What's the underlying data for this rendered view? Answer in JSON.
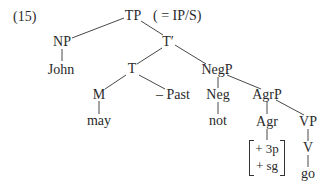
{
  "example_number": "(15)",
  "annotation": "( = IP/S)",
  "nodes": {
    "TP": "TP",
    "NP": "NP",
    "T_bar": "T′",
    "John": "John",
    "T": "T",
    "NegP": "NegP",
    "M": "M",
    "Past": "– Past",
    "Neg": "Neg",
    "AgrP": "AgrP",
    "may": "may",
    "not": "not",
    "Agr": "Agr",
    "VP": "VP",
    "V": "V",
    "go": "go"
  },
  "agr_features": [
    "+ 3p",
    "+ sg"
  ],
  "tree": {
    "label": "TP",
    "children": [
      {
        "label": "NP",
        "children": [
          {
            "label": "John"
          }
        ]
      },
      {
        "label": "T′",
        "children": [
          {
            "label": "T",
            "children": [
              {
                "label": "M",
                "children": [
                  {
                    "label": "may"
                  }
                ]
              },
              {
                "label": "– Past"
              }
            ]
          },
          {
            "label": "NegP",
            "children": [
              {
                "label": "Neg",
                "children": [
                  {
                    "label": "not"
                  }
                ]
              },
              {
                "label": "AgrP",
                "children": [
                  {
                    "label": "Agr",
                    "children": [
                      {
                        "label": "[+ 3p, + sg]"
                      }
                    ]
                  },
                  {
                    "label": "VP",
                    "children": [
                      {
                        "label": "V",
                        "children": [
                          {
                            "label": "go"
                          }
                        ]
                      }
                    ]
                  }
                ]
              }
            ]
          }
        ]
      }
    ]
  }
}
